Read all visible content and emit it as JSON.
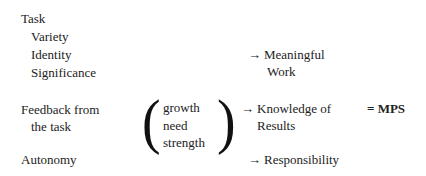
{
  "inputs": {
    "task": "Task",
    "variety": "Variety",
    "identity": "Identity",
    "significance": "Significance",
    "feedback_line1": "Feedback from",
    "feedback_line2": "the task",
    "autonomy": "Autonomy"
  },
  "moderator": {
    "open_paren": "(",
    "close_paren": ")",
    "line1": "growth",
    "line2": "need",
    "line3": "strength"
  },
  "outcomes": {
    "arrow": "→",
    "meaningful_line1": "Meaningful",
    "meaningful_line2": "Work",
    "knowledge_line1": "Knowledge of",
    "knowledge_line2": "Results",
    "responsibility": "Responsibility"
  },
  "result": {
    "label": "= MPS"
  }
}
